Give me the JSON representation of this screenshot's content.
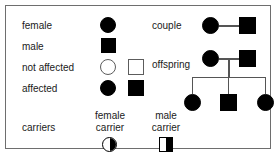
{
  "legend": {
    "rows": [
      {
        "label": "female",
        "symbols": [
          "filled-circle"
        ]
      },
      {
        "label": "male",
        "symbols": [
          "filled-square"
        ]
      },
      {
        "label": "not affected",
        "symbols": [
          "open-circle",
          "open-square"
        ]
      },
      {
        "label": "affected",
        "symbols": [
          "filled-circle",
          "filled-square"
        ]
      }
    ],
    "carriers": {
      "label": "carriers",
      "items": [
        {
          "label_line1": "female",
          "label_line2": "carrier",
          "symbol": "half-filled-circle"
        },
        {
          "label_line1": "male",
          "label_line2": "carrier",
          "symbol": "half-filled-square"
        }
      ]
    }
  },
  "pedigree": {
    "couple": {
      "label": "couple",
      "female_symbol": "filled-circle",
      "male_symbol": "filled-square"
    },
    "offspring": {
      "label": "offspring",
      "parents": {
        "female_symbol": "filled-circle",
        "male_symbol": "filled-square"
      },
      "children": [
        {
          "symbol": "filled-circle"
        },
        {
          "symbol": "filled-square"
        },
        {
          "symbol": "filled-circle"
        }
      ]
    }
  },
  "colors": {
    "symbol_fill": "#000000",
    "symbol_outline": "#5c5c5c",
    "connector_line": "#555555",
    "frame_border": "#6e6e6e",
    "text": "#1a1a1a",
    "background": "#ffffff"
  }
}
